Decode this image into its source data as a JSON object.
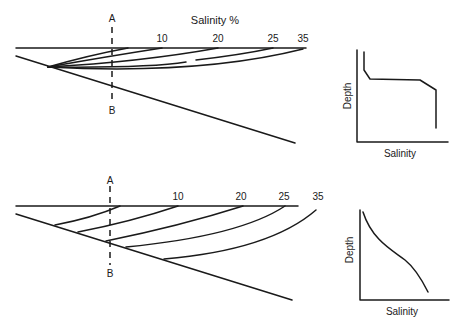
{
  "top_estuary": {
    "title": "Salinity %",
    "section_top_label": "A",
    "section_bottom_label": "B",
    "isohaline_labels": [
      "10",
      "20",
      "25",
      "35"
    ]
  },
  "top_profile": {
    "ylabel": "Depth",
    "xlabel": "Salinity"
  },
  "bottom_estuary": {
    "section_top_label": "A",
    "section_bottom_label": "B",
    "isohaline_labels": [
      "10",
      "20",
      "25",
      "35"
    ]
  },
  "bottom_profile": {
    "ylabel": "Depth",
    "xlabel": "Salinity"
  },
  "colors": {
    "ink": "#1a1a1a",
    "background": "#ffffff"
  }
}
